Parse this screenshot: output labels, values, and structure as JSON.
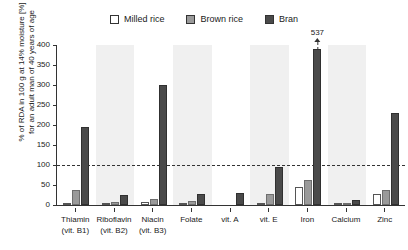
{
  "legend": {
    "items": [
      {
        "label": "Milled rice",
        "key": "milled",
        "color": "#ffffff"
      },
      {
        "label": "Brown rice",
        "key": "brown",
        "color": "#9a9a9a"
      },
      {
        "label": "Bran",
        "key": "bran",
        "color": "#4a4a4a"
      }
    ]
  },
  "axis": {
    "ylabel_line1": "% of RDA in 100 g at 14% moisture [%]",
    "ylabel_line2": "for an adult man of 40 years of age",
    "yticks": [
      "0",
      "50",
      "100",
      "150",
      "200",
      "250",
      "300",
      "350",
      "400"
    ]
  },
  "annotations": {
    "iron_bran_overflow": "537"
  },
  "chart_data": {
    "type": "bar",
    "title": "",
    "xlabel": "",
    "ylabel": "% of RDA in 100 g at 14% moisture [%] for an adult man of 40 years of age",
    "ylim": [
      0,
      400
    ],
    "ytick_step": 50,
    "grid": false,
    "legend_position": "top-center",
    "reference_line": {
      "value": 100,
      "style": "dashed",
      "label": "100% RDA"
    },
    "categories": [
      "Thiamin (vit. B1)",
      "Riboflavin (vit. B2)",
      "Niacin (vit. B3)",
      "Folate",
      "vit. A",
      "vit. E",
      "Iron",
      "Calcium",
      "Zinc"
    ],
    "category_lines": [
      [
        "Thiamin",
        "(vit. B1)"
      ],
      [
        "Riboflavin",
        "(vit. B2)"
      ],
      [
        "Niacin",
        "(vit. B3)"
      ],
      [
        "Folate",
        ""
      ],
      [
        "vit. A",
        ""
      ],
      [
        "vit. E",
        ""
      ],
      [
        "Iron",
        ""
      ],
      [
        "Calcium",
        ""
      ],
      [
        "Zinc",
        ""
      ]
    ],
    "series": [
      {
        "name": "Milled rice",
        "color": "#ffffff",
        "values": [
          5,
          2,
          8,
          3,
          0,
          5,
          45,
          4,
          28
        ]
      },
      {
        "name": "Brown rice",
        "color": "#9a9a9a",
        "values": [
          38,
          7,
          15,
          10,
          0,
          28,
          62,
          6,
          38
        ]
      },
      {
        "name": "Bran",
        "color": "#4a4a4a",
        "values": [
          195,
          25,
          300,
          28,
          30,
          95,
          537,
          13,
          230
        ]
      }
    ],
    "truncated_bars": [
      {
        "category": "Iron",
        "series": "Bran",
        "actual_value": 537,
        "displayed_cap": 390,
        "label": "537"
      }
    ],
    "shaded_band_categories": [
      "Riboflavin (vit. B2)",
      "Folate",
      "vit. E",
      "Calcium"
    ]
  }
}
